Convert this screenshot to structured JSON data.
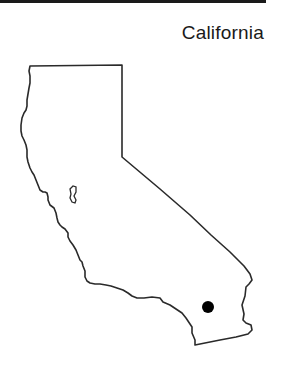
{
  "map": {
    "title": "California",
    "region": "California state outline",
    "marker": {
      "label": "location-marker",
      "color": "#000000"
    },
    "colors": {
      "outline": "#2a2a2a",
      "fill": "#ffffff",
      "rule": "#1a1a1a"
    }
  }
}
